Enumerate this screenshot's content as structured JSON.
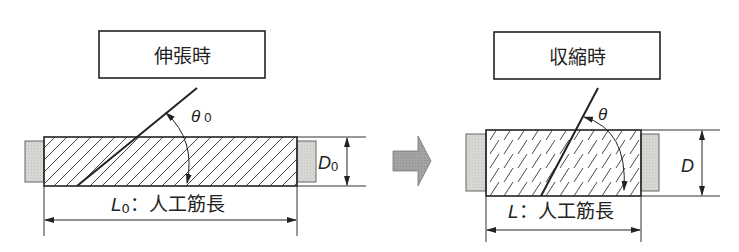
{
  "left_panel": {
    "title": "伸張時",
    "angle_label": "θ",
    "angle_subscript": "0",
    "diameter_label": "D",
    "diameter_subscript": "0",
    "length_label": "L",
    "length_subscript": "0",
    "length_caption": "：人工筋長"
  },
  "transition_arrow": {
    "icon": "right-arrow-icon",
    "color": "#9a9a9a"
  },
  "right_panel": {
    "title": "収縮時",
    "angle_label": "θ",
    "diameter_label": "D",
    "length_label": "L",
    "length_caption": "：人工筋長"
  },
  "colors": {
    "line": "#222222",
    "end_cap_fill": "#d9d9d6",
    "arrow_fill": "#9e9e9e"
  }
}
